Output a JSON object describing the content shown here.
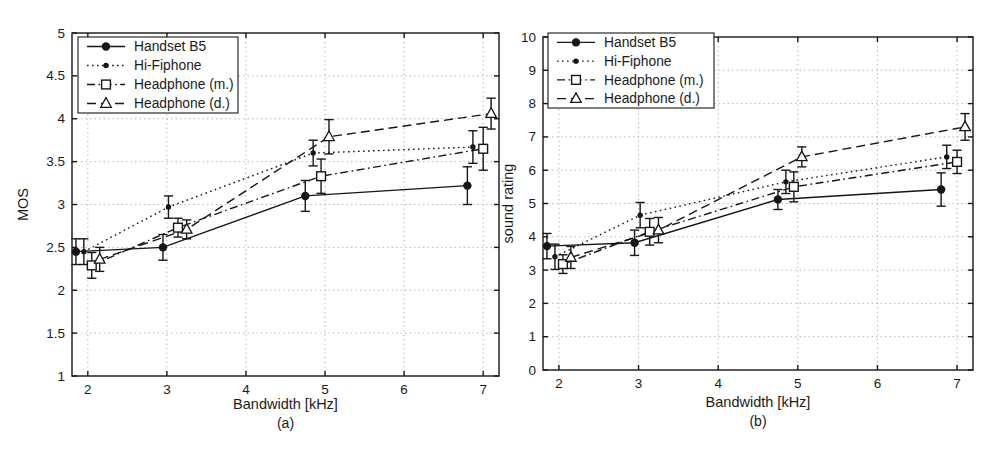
{
  "figure": {
    "type": "scientific-figure",
    "background": "#ffffff"
  },
  "colors": {
    "ink": "#161616",
    "grid": "#b9b9b9",
    "background": "#ffffff",
    "text": "#1b1b1b"
  },
  "legend": {
    "entries": [
      "Handset B5",
      "Hi-Fiphone",
      "Headphone (m.)",
      "Headphone (d.)"
    ],
    "position": "top-left"
  },
  "series_styles": [
    {
      "name": "Handset B5",
      "line": "solid",
      "marker": "filled-circle"
    },
    {
      "name": "Hi-Fiphone",
      "line": "dotted",
      "marker": "filled-dot"
    },
    {
      "name": "Headphone (m.)",
      "line": "dashdot",
      "marker": "open-square"
    },
    {
      "name": "Headphone (d.)",
      "line": "dashed",
      "marker": "open-triangle"
    }
  ],
  "chart_data": [
    {
      "type": "line",
      "id": "a",
      "caption": "(a)",
      "title": "",
      "xlabel": "Bandwidth [kHz]",
      "ylabel": "MOS",
      "xlim": [
        1.8,
        7.2
      ],
      "ylim": [
        1,
        5
      ],
      "xticks": [
        2,
        3,
        4,
        5,
        6,
        7
      ],
      "yticks": [
        1,
        1.5,
        2,
        2.5,
        3,
        3.5,
        4,
        4.5,
        5
      ],
      "grid": true,
      "legend_position": "top-left",
      "series": [
        {
          "name": "Handset B5",
          "x": [
            1.85,
            2.95,
            4.75,
            6.8
          ],
          "y": [
            2.45,
            2.5,
            3.1,
            3.22
          ],
          "yerr": [
            0.15,
            0.15,
            0.18,
            0.22
          ]
        },
        {
          "name": "Hi-Fiphone",
          "x": [
            1.95,
            3.02,
            4.85,
            6.87
          ],
          "y": [
            2.45,
            2.97,
            3.6,
            3.67
          ],
          "yerr": [
            0.15,
            0.13,
            0.15,
            0.19
          ]
        },
        {
          "name": "Headphone (m.)",
          "x": [
            2.05,
            3.14,
            4.95,
            7.0
          ],
          "y": [
            2.29,
            2.73,
            3.33,
            3.65
          ],
          "yerr": [
            0.15,
            0.11,
            0.2,
            0.25
          ]
        },
        {
          "name": "Headphone (d.)",
          "x": [
            2.15,
            3.25,
            5.05,
            7.1
          ],
          "y": [
            2.36,
            2.71,
            3.79,
            4.06
          ],
          "yerr": [
            0.14,
            0.11,
            0.2,
            0.18
          ]
        }
      ]
    },
    {
      "type": "line",
      "id": "b",
      "caption": "(b)",
      "title": "",
      "xlabel": "Bandwidth [kHz]",
      "ylabel": "sound rating",
      "xlim": [
        1.8,
        7.2
      ],
      "ylim": [
        0,
        10
      ],
      "xticks": [
        2,
        3,
        4,
        5,
        6,
        7
      ],
      "yticks": [
        0,
        1,
        2,
        3,
        4,
        5,
        6,
        7,
        8,
        9,
        10
      ],
      "grid": true,
      "legend_position": "top-left",
      "series": [
        {
          "name": "Handset B5",
          "x": [
            1.85,
            2.95,
            4.75,
            6.8
          ],
          "y": [
            3.72,
            3.82,
            5.12,
            5.42
          ],
          "yerr": [
            0.38,
            0.38,
            0.3,
            0.5
          ]
        },
        {
          "name": "Hi-Fiphone",
          "x": [
            1.95,
            3.02,
            4.85,
            6.87
          ],
          "y": [
            3.4,
            4.65,
            5.65,
            6.4
          ],
          "yerr": [
            0.38,
            0.38,
            0.35,
            0.35
          ]
        },
        {
          "name": "Headphone (m.)",
          "x": [
            2.05,
            3.14,
            4.95,
            7.0
          ],
          "y": [
            3.18,
            4.15,
            5.5,
            6.25
          ],
          "yerr": [
            0.28,
            0.4,
            0.45,
            0.35
          ]
        },
        {
          "name": "Headphone (d.)",
          "x": [
            2.15,
            3.25,
            5.05,
            7.1
          ],
          "y": [
            3.38,
            4.2,
            6.4,
            7.3
          ],
          "yerr": [
            0.33,
            0.38,
            0.3,
            0.4
          ]
        }
      ]
    }
  ]
}
